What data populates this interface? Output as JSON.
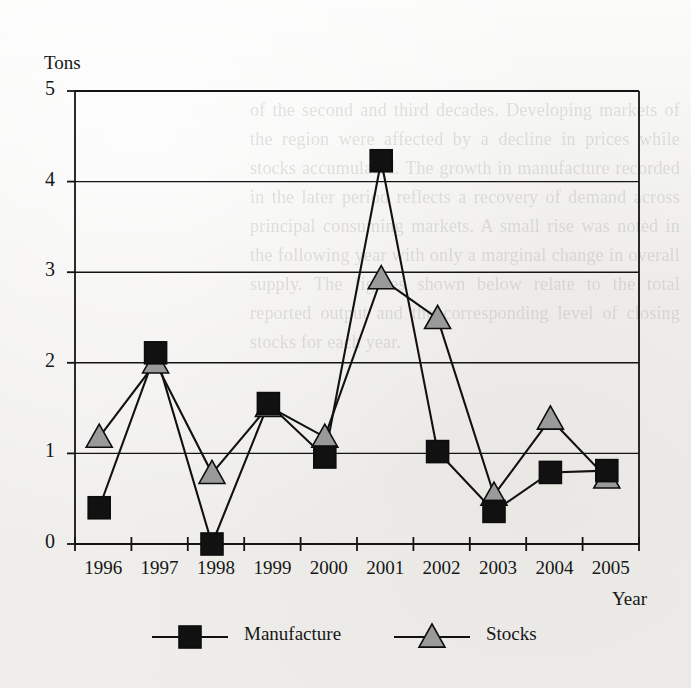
{
  "title": "",
  "chart_data": {
    "type": "line",
    "title": "",
    "xlabel": "Year",
    "ylabel": "Tons",
    "categories": [
      "1996",
      "1997",
      "1998",
      "1999",
      "2000",
      "2001",
      "2002",
      "2003",
      "2004",
      "2005"
    ],
    "series": [
      {
        "name": "Manufacture",
        "marker": "square",
        "color": "#111111",
        "values": [
          0.4,
          2.11,
          0.0,
          1.55,
          0.96,
          4.23,
          1.02,
          0.36,
          0.79,
          0.81
        ]
      },
      {
        "name": "Stocks",
        "marker": "triangle",
        "color": "#9a9a9a",
        "values": [
          1.18,
          2.0,
          0.78,
          1.52,
          1.18,
          2.93,
          2.49,
          0.54,
          1.38,
          0.73
        ]
      }
    ],
    "ylim": [
      0,
      5
    ],
    "yticks": [
      0,
      1,
      2,
      3,
      4,
      5
    ],
    "grid": true,
    "legend_position": "bottom",
    "line_color": "#111111"
  },
  "axes": {
    "y_title": "Tons",
    "x_title": "Year"
  },
  "legend": {
    "items": [
      {
        "label": "Manufacture",
        "marker": "square",
        "color": "#111111"
      },
      {
        "label": "Stocks",
        "marker": "triangle",
        "color": "#9a9a9a"
      }
    ]
  },
  "ghost_text": "of the second and third decades. Developing markets of the region were affected by a decline in prices while stocks accumulated. The growth in manufacture recorded in the later period reflects a recovery of demand across principal consuming markets. A small rise was noted in the following year with only a marginal change in overall supply. The figures shown below relate to the total reported output and the corresponding level of closing stocks for each year."
}
